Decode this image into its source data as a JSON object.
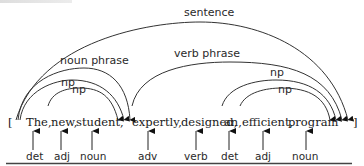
{
  "diagram": {
    "type": "constituency-arc-diagram",
    "open_bracket": "[",
    "close_bracket": "]",
    "tokens": [
      {
        "text": "The,",
        "pos": "det"
      },
      {
        "text": "new,",
        "pos": "adj"
      },
      {
        "text": "student,",
        "pos": "noun"
      },
      {
        "text": "expertly,",
        "pos": "adv"
      },
      {
        "text": "designed,",
        "pos": "verb"
      },
      {
        "text": "an,",
        "pos": "det"
      },
      {
        "text": "efficient,",
        "pos": "adj"
      },
      {
        "text": "program",
        "pos": "noun"
      }
    ],
    "arcs": [
      {
        "label": "sentence",
        "span": "The … program"
      },
      {
        "label": "noun phrase",
        "span": "The … student"
      },
      {
        "label": "np",
        "span": "The … student"
      },
      {
        "label": "np",
        "span": "new … student"
      },
      {
        "label": "verb phrase",
        "span": "expertly … program"
      },
      {
        "label": "np",
        "span": "an … program"
      },
      {
        "label": "np",
        "span": "efficient … program"
      }
    ]
  }
}
